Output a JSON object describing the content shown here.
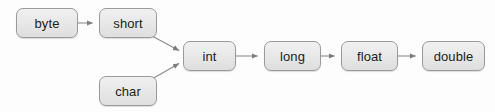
{
  "diagram": {
    "type": "flow-diagram",
    "background_color": "#fdfdfd",
    "node_fill_color": "#e9e9e9",
    "node_border_color": "#9a9a9a",
    "node_text_color": "#1c1c1c",
    "edge_color": "#8c8c8c",
    "nodes": [
      {
        "id": "byte",
        "label": "byte",
        "x": 16,
        "y": 8,
        "w": 62,
        "h": 30
      },
      {
        "id": "short",
        "label": "short",
        "x": 99,
        "y": 8,
        "w": 58,
        "h": 30
      },
      {
        "id": "char",
        "label": "char",
        "x": 99,
        "y": 76,
        "w": 58,
        "h": 30
      },
      {
        "id": "int",
        "label": "int",
        "x": 183,
        "y": 41,
        "w": 53,
        "h": 30
      },
      {
        "id": "long",
        "label": "long",
        "x": 264,
        "y": 41,
        "w": 57,
        "h": 30
      },
      {
        "id": "float",
        "label": "float",
        "x": 341,
        "y": 41,
        "w": 57,
        "h": 30
      },
      {
        "id": "double",
        "label": "double",
        "x": 422,
        "y": 41,
        "w": 63,
        "h": 30
      }
    ],
    "edges": [
      {
        "id": "byte-to-short",
        "from": "byte",
        "to": "short",
        "direction": "right"
      },
      {
        "id": "short-to-int",
        "from": "short",
        "to": "int",
        "direction": "diagonal-down-right"
      },
      {
        "id": "char-to-int",
        "from": "char",
        "to": "int",
        "direction": "diagonal-up-right"
      },
      {
        "id": "int-to-long",
        "from": "int",
        "to": "long",
        "direction": "right"
      },
      {
        "id": "long-to-float",
        "from": "long",
        "to": "float",
        "direction": "right"
      },
      {
        "id": "float-to-double",
        "from": "float",
        "to": "double",
        "direction": "right"
      }
    ]
  }
}
